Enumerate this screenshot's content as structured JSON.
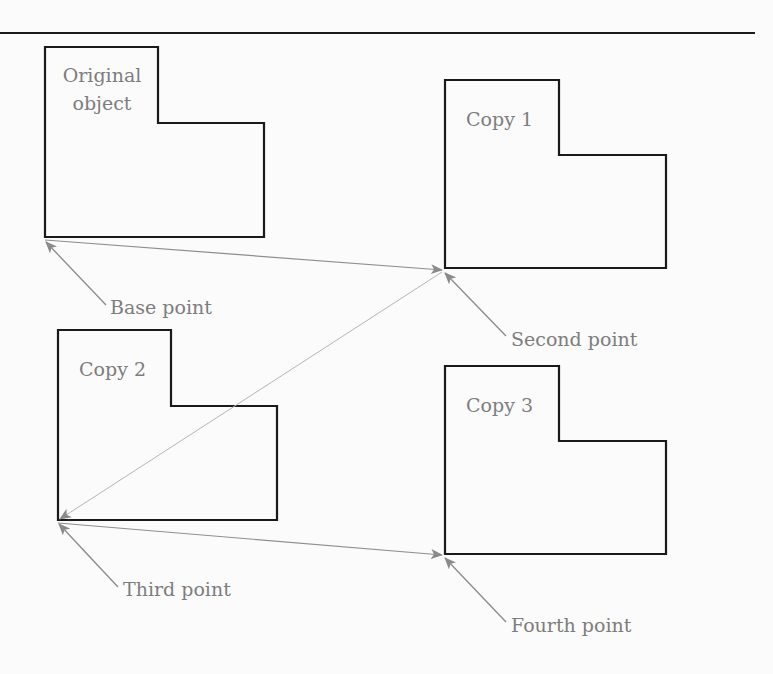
{
  "diagram": {
    "type": "copy-multiple-objects",
    "colors": {
      "outline": "#1a1a1a",
      "label": "#7d7d7d",
      "arrow": "#8a8a8a",
      "path_line": "#9a9a9a",
      "background": "#fbfbfb"
    },
    "objects": [
      {
        "id": "original",
        "label_lines": [
          "Original",
          "object"
        ]
      },
      {
        "id": "copy1",
        "label_lines": [
          "Copy 1"
        ]
      },
      {
        "id": "copy2",
        "label_lines": [
          "Copy 2"
        ]
      },
      {
        "id": "copy3",
        "label_lines": [
          "Copy 3"
        ]
      }
    ],
    "points": [
      {
        "id": "base",
        "label": "Base point"
      },
      {
        "id": "second",
        "label": "Second point"
      },
      {
        "id": "third",
        "label": "Third point"
      },
      {
        "id": "fourth",
        "label": "Fourth point"
      }
    ],
    "connections": [
      {
        "from": "base",
        "to": "second"
      },
      {
        "from": "second",
        "to": "third"
      },
      {
        "from": "third",
        "to": "fourth"
      }
    ]
  }
}
